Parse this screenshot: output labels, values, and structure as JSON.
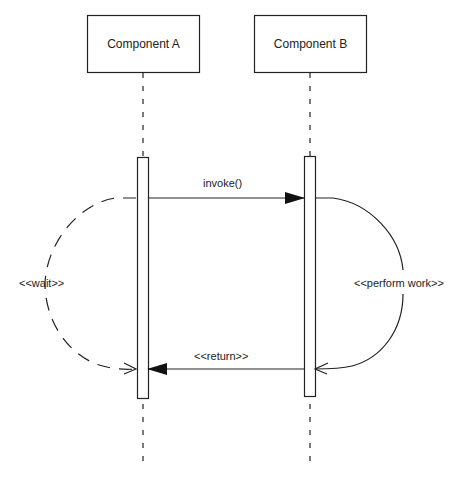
{
  "diagram": {
    "type": "sequence",
    "participants": [
      {
        "id": "A",
        "label": "Component A"
      },
      {
        "id": "B",
        "label": "Component B"
      }
    ],
    "messages": [
      {
        "from": "A",
        "to": "B",
        "label": "invoke()",
        "style": "solid-filled-arrow"
      },
      {
        "from": "B",
        "to": "A",
        "label": "<<return>>",
        "style": "solid-filled-arrow"
      }
    ],
    "annotations": [
      {
        "side": "left",
        "label": "<<wait>>",
        "style": "dashed-arc-open-arrow"
      },
      {
        "side": "right",
        "label": "<<perform work>>",
        "style": "solid-arc-open-arrow"
      }
    ]
  },
  "colors": {
    "stroke": "#222222",
    "background": "#ffffff"
  }
}
